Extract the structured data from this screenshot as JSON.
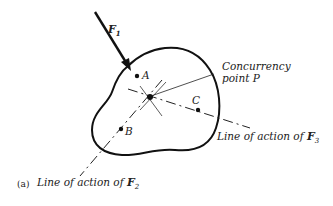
{
  "figure": {
    "panel_label": "(a)",
    "force_label": "F",
    "force_subscript": "1",
    "points": {
      "A": "A",
      "B": "B",
      "C": "C"
    },
    "concurrency_line1": "Concurrency",
    "concurrency_line2": "point P",
    "line_f3_text": "Line of action of ",
    "line_f3_force": "F",
    "line_f3_sub": "3",
    "line_f2_text": "Line of action of ",
    "line_f2_force": "F",
    "line_f2_sub": "2"
  }
}
